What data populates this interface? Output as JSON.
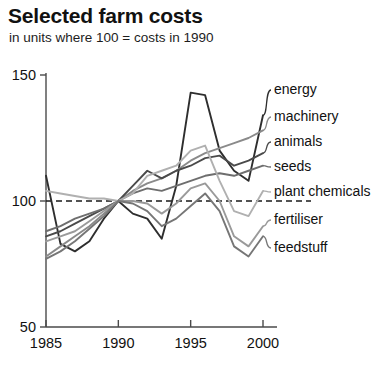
{
  "title": "Selected farm costs",
  "subtitle": "in units where 100 = costs in 1990",
  "chart_data": {
    "type": "line",
    "title": "Selected farm costs",
    "subtitle": "in units where 100 = costs in 1990",
    "xlabel": "",
    "ylabel": "",
    "xlim": [
      1985,
      2000
    ],
    "ylim": [
      50,
      150
    ],
    "yticks": [
      50,
      100,
      150
    ],
    "xticks": [
      1985,
      1990,
      1995,
      2000
    ],
    "grid": false,
    "legend_position": "right-inline-labels",
    "reference_line": {
      "value": 100,
      "style": "dashed",
      "label": "100 = 1990 costs"
    },
    "x": [
      1985,
      1986,
      1987,
      1988,
      1989,
      1990,
      1991,
      1992,
      1993,
      1994,
      1995,
      1996,
      1997,
      1998,
      1999,
      2000
    ],
    "series": [
      {
        "name": "energy",
        "color": "#2e2e2e",
        "values": [
          110,
          83,
          80,
          84,
          93,
          100,
          95,
          93,
          85,
          106,
          143,
          142,
          120,
          112,
          108,
          134
        ]
      },
      {
        "name": "machinery",
        "color": "#8a8a8a",
        "values": [
          78,
          82,
          86,
          90,
          95,
          100,
          104,
          107,
          109,
          112,
          116,
          119,
          121,
          123,
          125,
          128
        ]
      },
      {
        "name": "animals",
        "color": "#4a4a4a",
        "values": [
          86,
          88,
          91,
          94,
          97,
          100,
          106,
          112,
          109,
          112,
          114,
          117,
          118,
          114,
          116,
          119
        ]
      },
      {
        "name": "seeds",
        "color": "#6e6e6e",
        "values": [
          88,
          90,
          93,
          95,
          97,
          100,
          103,
          105,
          104,
          106,
          108,
          110,
          111,
          110,
          112,
          114
        ]
      },
      {
        "name": "plant chemicals",
        "color": "#b0b0b0",
        "values": [
          104,
          103,
          102,
          101,
          101,
          100,
          103,
          110,
          112,
          114,
          120,
          122,
          108,
          96,
          94,
          104
        ]
      },
      {
        "name": "fertiliser",
        "color": "#9a9a9a",
        "values": [
          84,
          86,
          88,
          92,
          96,
          100,
          100,
          99,
          95,
          99,
          105,
          107,
          100,
          86,
          82,
          90
        ]
      },
      {
        "name": "feedstuff",
        "color": "#767676",
        "values": [
          77,
          80,
          84,
          89,
          94,
          100,
          99,
          96,
          90,
          93,
          98,
          103,
          96,
          82,
          78,
          86
        ]
      }
    ]
  },
  "legend": [
    {
      "label": "energy"
    },
    {
      "label": "machinery"
    },
    {
      "label": "animals"
    },
    {
      "label": "seeds"
    },
    {
      "label": "plant chemicals"
    },
    {
      "label": "fertiliser"
    },
    {
      "label": "feedstuff"
    }
  ]
}
